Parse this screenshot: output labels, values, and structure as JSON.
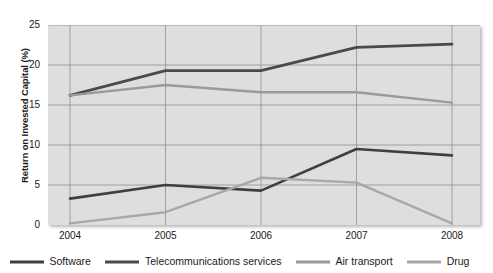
{
  "chart_data": {
    "type": "line",
    "title": "",
    "xlabel": "",
    "ylabel": "Return on Invested Capital (%)",
    "categories": [
      "2004",
      "2005",
      "2006",
      "2007",
      "2008"
    ],
    "x": [
      2004,
      2005,
      2006,
      2007,
      2008
    ],
    "xlim": [
      2004,
      2008
    ],
    "ylim": [
      0,
      25
    ],
    "yticks": [
      "0",
      "5",
      "10",
      "15",
      "20",
      "25"
    ],
    "ytick_values": [
      0,
      5,
      10,
      15,
      20,
      25
    ],
    "grid": true,
    "legend_position": "bottom",
    "series": [
      {
        "name": "Software",
        "color": "#3f3f3f",
        "width": 2.6,
        "values": [
          3.3,
          5.0,
          4.3,
          9.5,
          8.7
        ]
      },
      {
        "name": "Telecommunications services",
        "color": "#4a4a4a",
        "width": 2.8,
        "values": [
          16.2,
          19.3,
          19.3,
          22.2,
          22.6
        ]
      },
      {
        "name": "Air transport",
        "color": "#9a9a9a",
        "width": 2.4,
        "values": [
          16.2,
          17.5,
          16.6,
          16.6,
          15.3
        ]
      },
      {
        "name": "Drug",
        "color": "#a8a8a8",
        "width": 2.4,
        "values": [
          0.2,
          1.6,
          5.9,
          5.3,
          0.2
        ]
      }
    ]
  },
  "plot_style": {
    "background": "#dedede",
    "gridline_color": "#8f8f8f",
    "axis_color": "#6e6e6e"
  }
}
